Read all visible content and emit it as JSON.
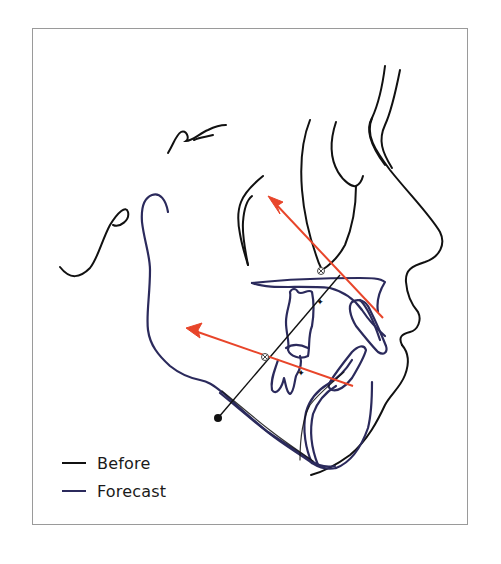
{
  "figure": {
    "type": "cephalometric profile tracing",
    "colors": {
      "before": "#111111",
      "forecast": "#2b2a5c",
      "vector": "#e8452a",
      "frame": "#9a9a9a"
    }
  },
  "legend": {
    "items": [
      {
        "label": "Before",
        "color": "#111111"
      },
      {
        "label": "Forecast",
        "color": "#2b2a5c"
      }
    ]
  },
  "annotations": {
    "vectors": [
      {
        "name": "upper-incisor-movement-vector",
        "from": [
          383,
          318
        ],
        "to": [
          268,
          196
        ]
      },
      {
        "name": "lower-incisor-movement-vector",
        "from": [
          353,
          386
        ],
        "to": [
          186,
          328
        ]
      }
    ],
    "landmarks": [
      {
        "name": "upper-landmark",
        "symbol": "⊗",
        "x": 321,
        "y": 271
      },
      {
        "name": "lower-landmark",
        "symbol": "⊗",
        "x": 265,
        "y": 357
      }
    ],
    "reference_point": {
      "name": "gonion-point",
      "x": 218,
      "y": 418
    }
  }
}
